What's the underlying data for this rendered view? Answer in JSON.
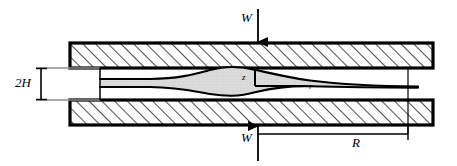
{
  "figure": {
    "name": "squeeze-film-flow-between-parallel-plates",
    "background_color": "#ffffff",
    "line_color": "#000000",
    "plate_fill": "#ffffff",
    "plate_hatch_color": "#000000",
    "fluid_fill": "#dcdcdc",
    "dimension_line_color": "#808080"
  },
  "labels": {
    "load_top": "W",
    "load_bottom": "W",
    "gap_height": "2H",
    "radius": "R",
    "axis_z": "z",
    "axis_r": "r"
  },
  "geometry": {
    "plate_left_x": 70,
    "plate_right_x": 433,
    "top_plate_y_top": 43,
    "top_plate_y_bottom": 68,
    "bottom_plate_y_top": 100,
    "bottom_plate_y_bottom": 125,
    "plate_border_width": 3,
    "gap_center_y": 84,
    "fluid_left_x": 100,
    "fluid_right_x": 418,
    "lens_center_x": 232,
    "lens_half_height": 16,
    "origin_x": 255,
    "origin_y": 84,
    "radius_dim_left_x": 258,
    "radius_dim_right_x": 408,
    "radius_dim_y": 134,
    "gap_dim_x": 41,
    "gap_dim_top_y": 68,
    "gap_dim_bottom_y": 100,
    "arrow_top_x": 258,
    "arrow_top_y_start": 10,
    "arrow_top_y_end": 43,
    "arrow_bottom_x": 258,
    "arrow_bottom_y_start": 160,
    "arrow_bottom_y_end": 125
  }
}
